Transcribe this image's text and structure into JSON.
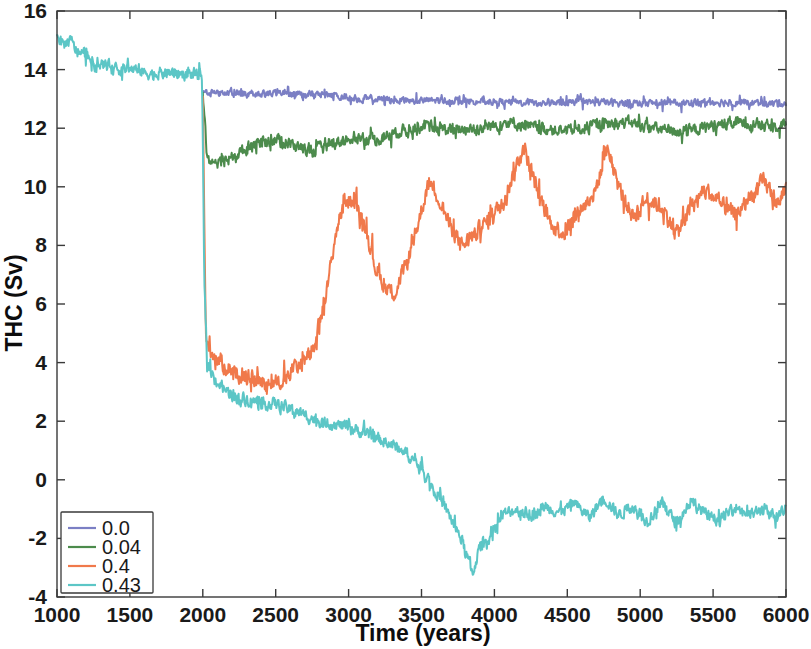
{
  "chart_data": {
    "type": "line",
    "title": "",
    "xlabel": "Time (years)",
    "ylabel": "THC (Sv)",
    "xlim": [
      1000,
      6000
    ],
    "ylim": [
      -4,
      16
    ],
    "xticks": [
      1000,
      1500,
      2000,
      2500,
      3000,
      3500,
      4000,
      4500,
      5000,
      5500,
      6000
    ],
    "yticks": [
      -4,
      -2,
      0,
      2,
      4,
      6,
      8,
      10,
      12,
      14,
      16
    ],
    "xtick_labels": [
      "1000",
      "1500",
      "2000",
      "2500",
      "3000",
      "3500",
      "4000",
      "4500",
      "5000",
      "5500",
      "6000"
    ],
    "ytick_labels": [
      "-4",
      "-2",
      "0",
      "2",
      "4",
      "6",
      "8",
      "10",
      "12",
      "14",
      "16"
    ],
    "grid": false,
    "legend_position": "lower-left",
    "legend_title": "",
    "branch_year": 2000,
    "series": [
      {
        "name": "0.0",
        "color": "#7B7FC4",
        "x_start": 2000,
        "noise": 0.18,
        "anchors": [
          [
            2000,
            13.25
          ],
          [
            2200,
            13.2
          ],
          [
            2500,
            13.2
          ],
          [
            2800,
            13.15
          ],
          [
            3100,
            13.0
          ],
          [
            3400,
            12.95
          ],
          [
            3700,
            12.95
          ],
          [
            4000,
            12.9
          ],
          [
            4300,
            12.85
          ],
          [
            4600,
            12.9
          ],
          [
            4900,
            12.85
          ],
          [
            5200,
            12.85
          ],
          [
            5500,
            12.9
          ],
          [
            5800,
            12.85
          ],
          [
            6000,
            12.85
          ]
        ]
      },
      {
        "name": "0.04",
        "color": "#4C8B4C",
        "x_start": 2000,
        "noise": 0.3,
        "anchors": [
          [
            2000,
            13.2
          ],
          [
            2030,
            11.0
          ],
          [
            2100,
            10.7
          ],
          [
            2200,
            11.0
          ],
          [
            2350,
            11.45
          ],
          [
            2500,
            11.6
          ],
          [
            2600,
            11.45
          ],
          [
            2750,
            11.2
          ],
          [
            2900,
            11.5
          ],
          [
            3050,
            11.7
          ],
          [
            3200,
            11.6
          ],
          [
            3350,
            11.9
          ],
          [
            3500,
            12.05
          ],
          [
            3700,
            11.95
          ],
          [
            3900,
            12.0
          ],
          [
            4100,
            12.2
          ],
          [
            4300,
            12.0
          ],
          [
            4500,
            11.9
          ],
          [
            4700,
            12.1
          ],
          [
            4900,
            12.2
          ],
          [
            5100,
            12.0
          ],
          [
            5300,
            11.85
          ],
          [
            5500,
            12.1
          ],
          [
            5700,
            12.2
          ],
          [
            5900,
            12.05
          ],
          [
            6000,
            12.2
          ]
        ]
      },
      {
        "name": "0.4",
        "color": "#F0794B",
        "x_start": 2000,
        "noise": 0.42,
        "anchors": [
          [
            2000,
            13.1
          ],
          [
            2020,
            5.0
          ],
          [
            2060,
            4.3
          ],
          [
            2150,
            3.9
          ],
          [
            2250,
            3.6
          ],
          [
            2350,
            3.4
          ],
          [
            2450,
            3.3
          ],
          [
            2550,
            3.4
          ],
          [
            2650,
            3.9
          ],
          [
            2750,
            4.3
          ],
          [
            2850,
            6.4
          ],
          [
            2920,
            8.6
          ],
          [
            2980,
            9.6
          ],
          [
            3050,
            9.4
          ],
          [
            3120,
            8.6
          ],
          [
            3180,
            7.3
          ],
          [
            3250,
            6.6
          ],
          [
            3320,
            6.4
          ],
          [
            3400,
            7.4
          ],
          [
            3470,
            8.6
          ],
          [
            3550,
            10.2
          ],
          [
            3620,
            9.6
          ],
          [
            3700,
            8.6
          ],
          [
            3780,
            8.0
          ],
          [
            3850,
            8.3
          ],
          [
            3950,
            8.8
          ],
          [
            4050,
            9.4
          ],
          [
            4150,
            10.7
          ],
          [
            4200,
            11.4
          ],
          [
            4280,
            10.1
          ],
          [
            4380,
            8.8
          ],
          [
            4480,
            8.4
          ],
          [
            4580,
            9.2
          ],
          [
            4680,
            9.7
          ],
          [
            4780,
            11.3
          ],
          [
            4850,
            10.0
          ],
          [
            4950,
            9.0
          ],
          [
            5050,
            9.6
          ],
          [
            5150,
            9.3
          ],
          [
            5250,
            8.4
          ],
          [
            5350,
            9.3
          ],
          [
            5450,
            9.9
          ],
          [
            5550,
            9.4
          ],
          [
            5650,
            9.0
          ],
          [
            5750,
            9.6
          ],
          [
            5850,
            10.2
          ],
          [
            5950,
            9.4
          ],
          [
            6000,
            10.0
          ]
        ]
      },
      {
        "name": "0.43",
        "color": "#5CC6C6",
        "x_start": 1000,
        "noise": 0.3,
        "anchors": [
          [
            1000,
            15.2
          ],
          [
            1040,
            14.85
          ],
          [
            1090,
            15.0
          ],
          [
            1140,
            14.6
          ],
          [
            1200,
            14.5
          ],
          [
            1260,
            14.15
          ],
          [
            1320,
            14.2
          ],
          [
            1400,
            14.0
          ],
          [
            1480,
            14.05
          ],
          [
            1560,
            13.95
          ],
          [
            1650,
            13.85
          ],
          [
            1750,
            13.9
          ],
          [
            1850,
            13.85
          ],
          [
            1950,
            13.85
          ],
          [
            1995,
            13.8
          ],
          [
            2010,
            7.0
          ],
          [
            2030,
            4.0
          ],
          [
            2060,
            3.6
          ],
          [
            2120,
            3.2
          ],
          [
            2200,
            2.9
          ],
          [
            2300,
            2.75
          ],
          [
            2400,
            2.6
          ],
          [
            2500,
            2.6
          ],
          [
            2600,
            2.4
          ],
          [
            2700,
            2.2
          ],
          [
            2800,
            2.0
          ],
          [
            2900,
            1.9
          ],
          [
            3000,
            1.8
          ],
          [
            3100,
            1.6
          ],
          [
            3200,
            1.4
          ],
          [
            3300,
            1.2
          ],
          [
            3400,
            0.9
          ],
          [
            3500,
            0.4
          ],
          [
            3600,
            -0.4
          ],
          [
            3700,
            -1.3
          ],
          [
            3780,
            -2.1
          ],
          [
            3850,
            -3.2
          ],
          [
            3900,
            -2.3
          ],
          [
            3980,
            -1.9
          ],
          [
            4060,
            -1.2
          ],
          [
            4150,
            -1.0
          ],
          [
            4250,
            -1.2
          ],
          [
            4350,
            -0.9
          ],
          [
            4450,
            -1.1
          ],
          [
            4550,
            -0.8
          ],
          [
            4650,
            -1.3
          ],
          [
            4750,
            -0.6
          ],
          [
            4850,
            -1.2
          ],
          [
            4950,
            -0.9
          ],
          [
            5050,
            -1.4
          ],
          [
            5150,
            -0.8
          ],
          [
            5250,
            -1.5
          ],
          [
            5350,
            -0.7
          ],
          [
            5450,
            -1.2
          ],
          [
            5550,
            -1.4
          ],
          [
            5650,
            -0.9
          ],
          [
            5750,
            -1.2
          ],
          [
            5850,
            -1.0
          ],
          [
            5950,
            -1.3
          ],
          [
            6000,
            -0.9
          ]
        ]
      }
    ],
    "legend_entries": [
      {
        "label": "0.0",
        "color": "#7B7FC4"
      },
      {
        "label": "0.04",
        "color": "#4C8B4C"
      },
      {
        "label": "0.4",
        "color": "#F0794B"
      },
      {
        "label": "0.43",
        "color": "#5CC6C6"
      }
    ]
  },
  "axes": {
    "x_title": "Time (years)",
    "y_title": "THC (Sv)"
  }
}
